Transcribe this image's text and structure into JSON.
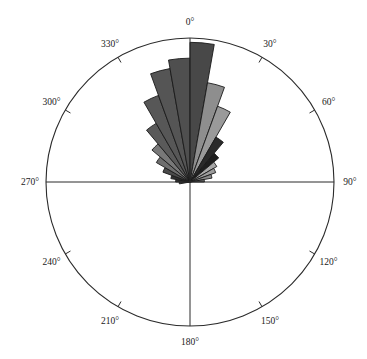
{
  "figure": {
    "name": "polar-rose-diagram",
    "background_color": "#ffffff",
    "outline_color": "#2b2b2b",
    "petal_edge_color": "#1a1a1a"
  },
  "geometry": {
    "center_x": 190,
    "center_y": 182,
    "radius": 144,
    "tick_length": 6,
    "label_offset": 16
  },
  "axes": {
    "tick_labels": [
      "0°",
      "30°",
      "60°",
      "90°",
      "120°",
      "150°",
      "180°",
      "210°",
      "240°",
      "270°",
      "300°",
      "330°"
    ],
    "tick_angles_deg": [
      0,
      30,
      60,
      90,
      120,
      150,
      180,
      210,
      240,
      270,
      300,
      330
    ],
    "cross_hair_angles_deg": [
      0,
      90,
      180,
      270
    ]
  },
  "chart_data": {
    "type": "bar",
    "subtype": "polar-rose-histogram",
    "title": "",
    "xlabel": "",
    "ylabel": "",
    "angle_unit": "degrees",
    "angle_origin": "north",
    "angle_direction": "clockwise",
    "bin_width_deg": 10,
    "rmax": 1.0,
    "grid": false,
    "legend": "none",
    "categories": [
      "260",
      "270",
      "280",
      "290",
      "300",
      "310",
      "320",
      "330",
      "340",
      "350",
      "0",
      "10",
      "20",
      "30",
      "40",
      "50",
      "60",
      "70",
      "80"
    ],
    "bins": [
      {
        "angle_start": 260,
        "angle_end": 270,
        "center": 265,
        "value": 0.075,
        "color": "#5c5c5c"
      },
      {
        "angle_start": 270,
        "angle_end": 280,
        "center": 275,
        "value": 0.1,
        "color": "#3a3a3a"
      },
      {
        "angle_start": 280,
        "angle_end": 290,
        "center": 285,
        "value": 0.135,
        "color": "#2e2e2e"
      },
      {
        "angle_start": 290,
        "angle_end": 300,
        "center": 295,
        "value": 0.2,
        "color": "#4a4a4a"
      },
      {
        "angle_start": 300,
        "angle_end": 310,
        "center": 305,
        "value": 0.27,
        "color": "#6e6e6e"
      },
      {
        "angle_start": 310,
        "angle_end": 320,
        "center": 315,
        "value": 0.345,
        "color": "#787878"
      },
      {
        "angle_start": 320,
        "angle_end": 330,
        "center": 325,
        "value": 0.47,
        "color": "#5a5a5a"
      },
      {
        "angle_start": 330,
        "angle_end": 340,
        "center": 335,
        "value": 0.64,
        "color": "#575757"
      },
      {
        "angle_start": 340,
        "angle_end": 350,
        "center": 345,
        "value": 0.8,
        "color": "#555555"
      },
      {
        "angle_start": 350,
        "angle_end": 0,
        "center": 355,
        "value": 0.86,
        "color": "#4f4f4f"
      },
      {
        "angle_start": 0,
        "angle_end": 10,
        "center": 5,
        "value": 0.97,
        "color": "#484848"
      },
      {
        "angle_start": 10,
        "angle_end": 20,
        "center": 15,
        "value": 0.7,
        "color": "#8e8e8e"
      },
      {
        "angle_start": 20,
        "angle_end": 30,
        "center": 25,
        "value": 0.56,
        "color": "#9a9a9a"
      },
      {
        "angle_start": 30,
        "angle_end": 40,
        "center": 35,
        "value": 0.36,
        "color": "#2a2a2a"
      },
      {
        "angle_start": 40,
        "angle_end": 50,
        "center": 45,
        "value": 0.26,
        "color": "#1f1f1f"
      },
      {
        "angle_start": 50,
        "angle_end": 60,
        "center": 55,
        "value": 0.215,
        "color": "#a8a8a8"
      },
      {
        "angle_start": 60,
        "angle_end": 70,
        "center": 65,
        "value": 0.19,
        "color": "#9c9c9c"
      },
      {
        "angle_start": 70,
        "angle_end": 80,
        "center": 75,
        "value": 0.155,
        "color": "#8a8a8a"
      },
      {
        "angle_start": 80,
        "angle_end": 90,
        "center": 85,
        "value": 0.1,
        "color": "#6a6a6a"
      }
    ]
  }
}
